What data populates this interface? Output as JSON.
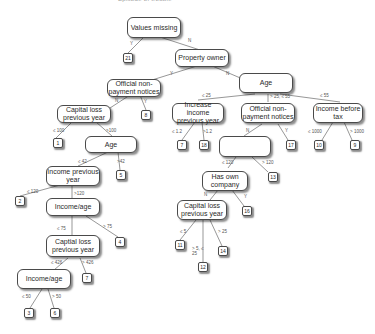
{
  "caption_partial": "Episode of trouble",
  "nodes": {
    "values_missing": "Values missing",
    "property_owner": "Property owner",
    "official_nonpayment_1": "Official non-payment notices",
    "age_1": "Age",
    "capital_loss_1": "Capital loss previous year",
    "age_2": "Age",
    "increase_income": "Increase income previous year",
    "official_nonpayment_2": "Official non-payment notices",
    "income_before_tax": "Income before tax",
    "income_prev_1": "Income previous year",
    "income_prev_2": "Income previous year",
    "has_own_company": "Has own company",
    "income_age_1": "Income/age",
    "capital_loss_2": "Capital loss previous year",
    "capital_loss_3": "Captial loss previous year",
    "income_age_2": "Income/age"
  },
  "leaves": {
    "l21": "21",
    "l8": "8",
    "l1": "1",
    "l5": "5",
    "l7": "7",
    "l18": "18",
    "l17": "17",
    "l10": "10",
    "l9": "9",
    "l13": "13",
    "l16": "16",
    "l11": "11",
    "l12": "12",
    "l14": "14",
    "l2": "2",
    "l4": "4",
    "l7b": "7",
    "l3": "3",
    "l6": "6"
  },
  "edges": {
    "vm_y": "Y",
    "vm_n": "N",
    "po_y": "Y",
    "po_n": "N",
    "onp1_n": "N",
    "onp1_y": "Y",
    "cl1_le": "≤ 100",
    "cl1_gt": ">100",
    "age2_le": "≤ 42",
    "age2_gt": ">42",
    "age1_le": "≤ 25",
    "age1_mid": "> 25, ≤ 55",
    "age1_gt": "≤ 55",
    "ii_le": "≤ 1.2",
    "ii_gt": ">1.2",
    "onp2_n": "N",
    "onp2_y": "Y",
    "ibt_le": "≤ 1000",
    "ibt_gt": "> 1000",
    "ip2_le": "≤ 120",
    "ip2_gt": "> 120",
    "hoc_n": "N",
    "hoc_y": "Y",
    "cl2_le": "≤ 5",
    "cl2_mid": "> 5, ≤ 25",
    "cl2_gt": "> 25",
    "ip1_le": "≤ 120",
    "ip1_gt": ">120",
    "ia1_le": "≤ 75",
    "ia1_gt": "> 75",
    "cl3_le": "≤ 426",
    "cl3_gt": "> 426",
    "ia2_le": "≤ 50",
    "ia2_gt": "> 50"
  }
}
